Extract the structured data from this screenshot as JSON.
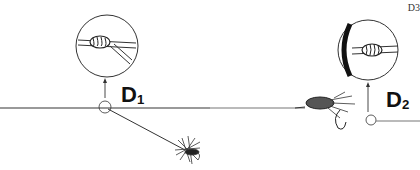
{
  "diagram": {
    "corner_label": "D3",
    "labels": [
      {
        "id": "d1",
        "main": "D",
        "sub": "1"
      },
      {
        "id": "d2",
        "main": "D",
        "sub": "2"
      }
    ],
    "colors": {
      "line": "#555555",
      "ink": "#111111",
      "background": "#ffffff"
    }
  }
}
